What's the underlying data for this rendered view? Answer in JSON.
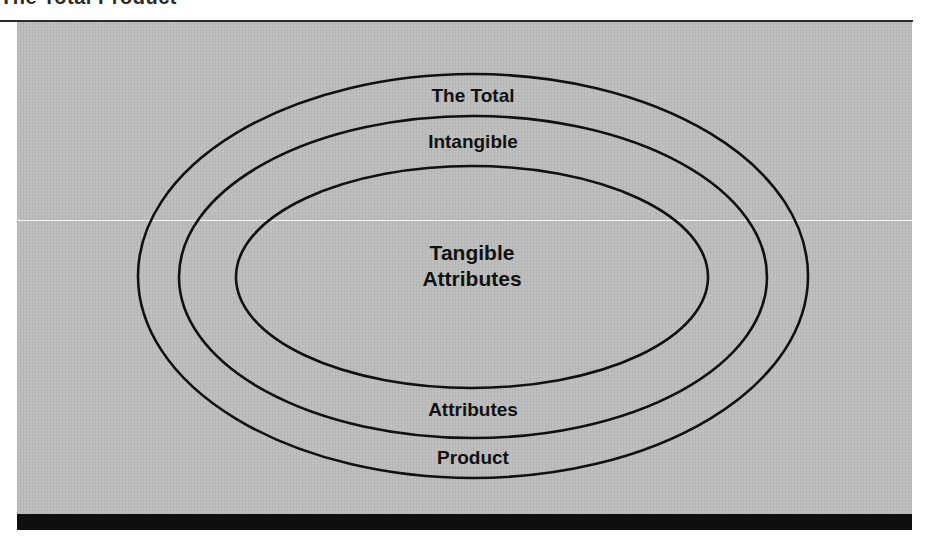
{
  "figure": {
    "title": "The Total Product"
  },
  "diagram": {
    "type": "concentric-ellipses",
    "rings": [
      {
        "name": "outer",
        "cx": 473,
        "cy": 276,
        "rx": 335,
        "ry": 202,
        "top_label": "The Total",
        "bottom_label": "Product"
      },
      {
        "name": "middle",
        "cx": 473,
        "cy": 277,
        "rx": 294,
        "ry": 161,
        "top_label": "Intangible",
        "bottom_label": "Attributes"
      },
      {
        "name": "inner",
        "cx": 472,
        "cy": 277,
        "rx": 236,
        "ry": 111,
        "center_label_line1": "Tangible",
        "center_label_line2": "Attributes"
      }
    ]
  },
  "colors": {
    "background": "#bdbdbd",
    "stroke": "#111111",
    "bar": "#0e0e0e"
  }
}
